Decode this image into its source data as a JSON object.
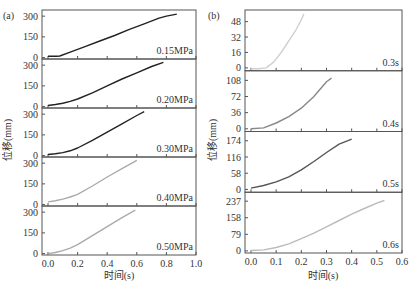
{
  "figure": {
    "left_label": "(a)",
    "right_label": "(b)",
    "ylabel": "位移(mm)",
    "xlabel": "时间(s)"
  },
  "chart_data": [
    {
      "id": "a",
      "type": "line",
      "title": "(a)",
      "xlabel": "时间(s)",
      "ylabel": "位移(mm)",
      "xlim": [
        0,
        1.0
      ],
      "xticks": [
        0.0,
        0.2,
        0.4,
        0.6,
        0.8,
        1.0
      ],
      "xtick_labels": [
        "0.0",
        "0.2",
        "0.4",
        "0.6",
        "0.8",
        "1.0"
      ],
      "grid": false,
      "panels": [
        {
          "label": "0.15MPa",
          "color": "#222222",
          "ylim": [
            -10,
            330
          ],
          "yticks": [
            0,
            150,
            300
          ],
          "x": [
            0.0,
            0.06,
            0.08,
            0.15,
            0.25,
            0.35,
            0.45,
            0.55,
            0.65,
            0.75,
            0.8,
            0.87
          ],
          "y": [
            10,
            10,
            12,
            40,
            80,
            120,
            160,
            205,
            245,
            285,
            300,
            315
          ]
        },
        {
          "label": "0.20MPa",
          "color": "#222222",
          "ylim": [
            -10,
            330
          ],
          "yticks": [
            0,
            150,
            300
          ],
          "x": [
            0.0,
            0.05,
            0.1,
            0.15,
            0.2,
            0.3,
            0.4,
            0.5,
            0.6,
            0.7,
            0.78
          ],
          "y": [
            8,
            15,
            25,
            38,
            55,
            100,
            150,
            200,
            245,
            290,
            320
          ]
        },
        {
          "label": "0.30MPa",
          "color": "#222222",
          "ylim": [
            -10,
            330
          ],
          "yticks": [
            0,
            150,
            300
          ],
          "x": [
            0.0,
            0.05,
            0.1,
            0.15,
            0.2,
            0.3,
            0.4,
            0.5,
            0.6,
            0.65
          ],
          "y": [
            8,
            13,
            22,
            35,
            55,
            110,
            170,
            230,
            290,
            318
          ]
        },
        {
          "label": "0.40MPa",
          "color": "#aaaaaa",
          "ylim": [
            -10,
            330
          ],
          "yticks": [
            0,
            150,
            300
          ],
          "x": [
            0.0,
            0.05,
            0.1,
            0.15,
            0.2,
            0.3,
            0.4,
            0.5,
            0.6
          ],
          "y": [
            20,
            28,
            40,
            55,
            75,
            135,
            200,
            260,
            320
          ]
        },
        {
          "label": "0.50MPa",
          "color": "#aaaaaa",
          "ylim": [
            -10,
            330
          ],
          "yticks": [
            0,
            150,
            300
          ],
          "x": [
            0.0,
            0.05,
            0.1,
            0.15,
            0.2,
            0.3,
            0.4,
            0.5,
            0.59
          ],
          "y": [
            0,
            8,
            22,
            40,
            65,
            130,
            195,
            260,
            315
          ]
        }
      ]
    },
    {
      "id": "b",
      "type": "line",
      "title": "(b)",
      "xlabel": "时间(s)",
      "ylabel": "位移(mm)",
      "xlim": [
        0,
        0.6
      ],
      "xticks": [
        0.0,
        0.1,
        0.2,
        0.3,
        0.4,
        0.5,
        0.6
      ],
      "xtick_labels": [
        "0.0",
        "0.1",
        "0.2",
        "0.3",
        "0.4",
        "0.5",
        "0.6"
      ],
      "grid": false,
      "panels": [
        {
          "label": "0.3s",
          "color": "#d0d0d0",
          "ylim": [
            -3,
            58
          ],
          "yticks": [
            0,
            16,
            32,
            48
          ],
          "x": [
            0.0,
            0.03,
            0.06,
            0.09,
            0.12,
            0.15,
            0.18,
            0.2,
            0.21
          ],
          "y": [
            -1,
            -1,
            0,
            6,
            16,
            28,
            40,
            50,
            56
          ]
        },
        {
          "label": "0.4s",
          "color": "#888888",
          "ylim": [
            -6,
            125
          ],
          "yticks": [
            0,
            36,
            72,
            108
          ],
          "x": [
            0.0,
            0.05,
            0.1,
            0.15,
            0.2,
            0.25,
            0.3,
            0.32
          ],
          "y": [
            0,
            2,
            13,
            27,
            46,
            72,
            105,
            113
          ]
        },
        {
          "label": "0.5s",
          "color": "#555555",
          "ylim": [
            -10,
            200
          ],
          "yticks": [
            0,
            58,
            116,
            174
          ],
          "x": [
            0.0,
            0.05,
            0.1,
            0.15,
            0.2,
            0.25,
            0.3,
            0.35,
            0.4
          ],
          "y": [
            5,
            14,
            27,
            45,
            70,
            100,
            132,
            162,
            180
          ]
        },
        {
          "label": "0.6s",
          "color": "#bbbbbb",
          "ylim": [
            -10,
            270
          ],
          "yticks": [
            0,
            79,
            158,
            237
          ],
          "x": [
            0.0,
            0.05,
            0.1,
            0.15,
            0.2,
            0.25,
            0.3,
            0.35,
            0.4,
            0.45,
            0.5,
            0.53
          ],
          "y": [
            2,
            5,
            16,
            34,
            58,
            85,
            115,
            145,
            175,
            202,
            228,
            240
          ]
        }
      ]
    }
  ]
}
